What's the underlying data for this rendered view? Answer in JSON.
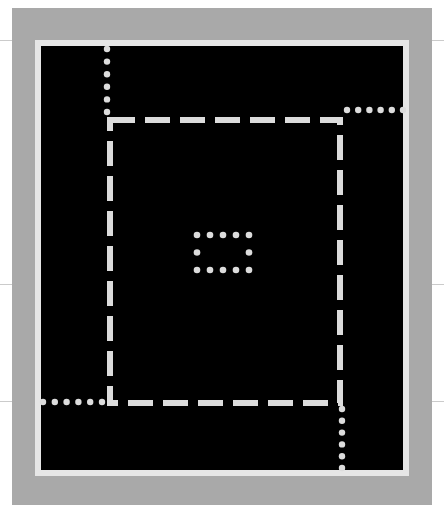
{
  "figure": {
    "type": "abstract-diagram",
    "colors": {
      "page_background": "#ffffff",
      "outer_mat": "#a9a9a9",
      "frame_border": "#e6e6e6",
      "panel": "#000000",
      "strokes": "#dcdcdc"
    },
    "elements": {
      "mat": {
        "x": 12,
        "y": 8,
        "w": 420,
        "h": 497
      },
      "frame": {
        "x": 35,
        "y": 40,
        "w": 374,
        "h": 436,
        "border": 6
      },
      "dashed_rect": {
        "x": 110,
        "y": 120,
        "w": 230,
        "h": 283,
        "stroke_width": 6,
        "dash": 25,
        "gap": 10
      },
      "dotted_lines": [
        {
          "name": "top-connector",
          "x1": 107,
          "y1": 49,
          "x2": 107,
          "y2": 112
        },
        {
          "name": "right-connector",
          "x1": 347,
          "y1": 110,
          "x2": 403,
          "y2": 110
        },
        {
          "name": "left-connector",
          "x1": 43,
          "y1": 402,
          "x2": 102,
          "y2": 402
        },
        {
          "name": "bottom-connector",
          "x1": 342,
          "y1": 409,
          "x2": 342,
          "y2": 468
        }
      ],
      "center_dotted_rect": {
        "x": 197,
        "y": 235,
        "w": 52,
        "h": 35,
        "dot_spacing": 13
      },
      "scanlines_y": [
        40,
        284,
        401
      ]
    }
  }
}
